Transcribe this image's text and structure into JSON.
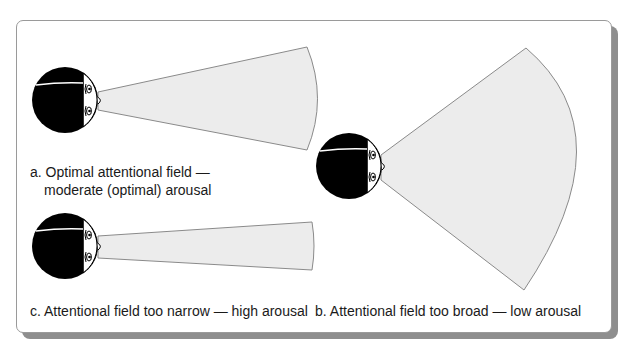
{
  "figure": {
    "panel_a": {
      "caption_line1": "a. Optimal attentional field —",
      "caption_line2": "moderate (optimal) arousal"
    },
    "panel_b": {
      "caption": "b. Attentional field too broad — low arousal"
    },
    "panel_c": {
      "caption": "c. Attentional field too narrow — high arousal"
    },
    "colors": {
      "cone_fill": "#ececec",
      "cone_stroke": "#8a8a8a",
      "head": "#000000",
      "panel_shadow": "#8e8e8e"
    }
  }
}
